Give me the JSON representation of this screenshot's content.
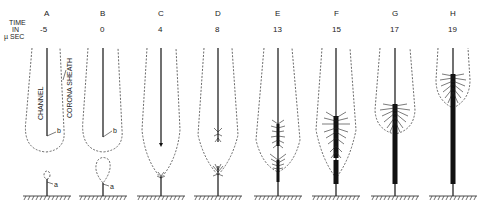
{
  "figure": {
    "axis_label": [
      "TIME",
      "IN",
      "µ SEC"
    ],
    "annotations": {
      "channel": "CHANNEL",
      "corona_sheath": "CORONA SHEATH",
      "point_a": "a",
      "point_b": "b"
    },
    "panels": [
      {
        "letter": "A",
        "time": "-5"
      },
      {
        "letter": "B",
        "time": "0"
      },
      {
        "letter": "C",
        "time": "4"
      },
      {
        "letter": "D",
        "time": "8"
      },
      {
        "letter": "E",
        "time": "13"
      },
      {
        "letter": "F",
        "time": "15"
      },
      {
        "letter": "G",
        "time": "17"
      },
      {
        "letter": "H",
        "time": "19"
      }
    ]
  }
}
